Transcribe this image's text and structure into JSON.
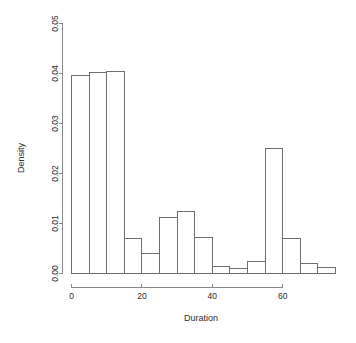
{
  "chart_data": {
    "type": "bar",
    "chart_subtype": "histogram",
    "title": "",
    "subtitle": "",
    "xlabel": "Duration",
    "ylabel": "Density",
    "xlim": [
      0,
      75
    ],
    "ylim": [
      0,
      0.05
    ],
    "grid": false,
    "legend": null,
    "bin_width": 5,
    "bin_edges": [
      0,
      5,
      10,
      15,
      20,
      25,
      30,
      35,
      40,
      45,
      50,
      55,
      60,
      65,
      70,
      75
    ],
    "categories": [
      "0-5",
      "5-10",
      "10-15",
      "15-20",
      "20-25",
      "25-30",
      "30-35",
      "35-40",
      "40-45",
      "45-50",
      "50-55",
      "55-60",
      "60-65",
      "65-70",
      "70-75"
    ],
    "values": [
      0.0396,
      0.0402,
      0.0405,
      0.007,
      0.004,
      0.0113,
      0.0125,
      0.0072,
      0.0014,
      0.0011,
      0.0025,
      0.0251,
      0.007,
      0.0021,
      0.0013
    ],
    "xaxis": {
      "ticks": [
        0,
        20,
        40,
        60
      ],
      "tick_labels": [
        "0",
        "20",
        "40",
        "60"
      ],
      "axis_start": 0,
      "axis_end": 60
    },
    "yaxis": {
      "ticks": [
        0.0,
        0.01,
        0.02,
        0.03,
        0.04,
        0.05
      ],
      "tick_labels": [
        "0.00",
        "0.01",
        "0.02",
        "0.03",
        "0.04",
        "0.05"
      ],
      "axis_start": 0.0,
      "axis_end": 0.05
    },
    "colors": {
      "bar_stroke": "#6e6e6e",
      "bar_fill": "none",
      "axis": "#888888",
      "text": "#2b2b2b",
      "background": "#ffffff"
    }
  },
  "labels": {
    "x_axis_title": "Duration",
    "y_axis_title": "Density",
    "x_tick_0": "0",
    "x_tick_1": "20",
    "x_tick_2": "40",
    "x_tick_3": "60",
    "y_tick_0": "0.00",
    "y_tick_1": "0.01",
    "y_tick_2": "0.02",
    "y_tick_3": "0.03",
    "y_tick_4": "0.04",
    "y_tick_5": "0.05"
  }
}
